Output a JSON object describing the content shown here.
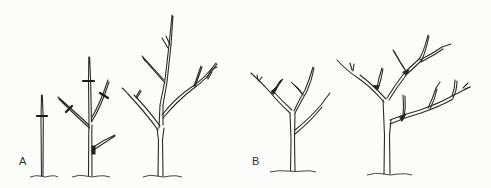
{
  "figure": {
    "panels": [
      {
        "label": "A",
        "trees": [
          {
            "stage": "whip",
            "cut_marks": 1
          },
          {
            "stage": "young branched tree",
            "cut_marks": 3,
            "side_shoot_removed": 1
          },
          {
            "stage": "trained tree with central leader",
            "cut_marks": 0
          }
        ]
      },
      {
        "label": "B",
        "trees": [
          {
            "stage": "young open-center tree",
            "cut_marks": 0
          },
          {
            "stage": "older open-center tree",
            "cut_marks": 0
          }
        ]
      }
    ],
    "colors": {
      "ink": "#2a2a2a",
      "background": "#fcfcfa"
    }
  }
}
